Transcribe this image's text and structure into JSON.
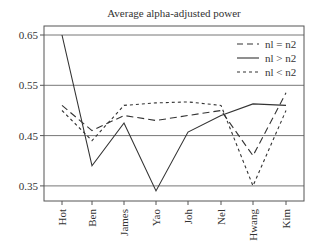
{
  "chart_data": {
    "type": "line",
    "title": "Average alpha-adjusted power",
    "xlabel": "",
    "ylabel": "",
    "categories": [
      "Hot",
      "Ben",
      "James",
      "Yao",
      "Joh",
      "Nel",
      "Hwang",
      "Kim"
    ],
    "yticks": [
      "0.65",
      "0.55",
      "0.45",
      "0.35"
    ],
    "ylim": [
      0.32,
      0.66
    ],
    "grid": "horizontal at y ticks",
    "legend_position": "upper right",
    "series": [
      {
        "name": "nl = n2",
        "style": "long-dash",
        "values": [
          0.51,
          0.46,
          0.49,
          0.48,
          0.49,
          0.5,
          0.41,
          0.535
        ]
      },
      {
        "name": "nl > n2",
        "style": "solid",
        "values": [
          0.65,
          0.39,
          0.475,
          0.34,
          0.457,
          0.49,
          0.513,
          0.51
        ]
      },
      {
        "name": "nl < n2",
        "style": "short-dash",
        "values": [
          0.5,
          0.44,
          0.51,
          0.515,
          0.517,
          0.51,
          0.35,
          0.5
        ]
      }
    ]
  },
  "legend": {
    "items": [
      {
        "label": "nl = n2"
      },
      {
        "label": "nl > n2"
      },
      {
        "label": "nl < n2"
      }
    ]
  }
}
